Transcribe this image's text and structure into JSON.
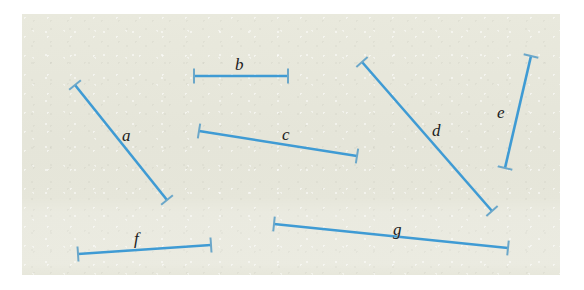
{
  "figure": {
    "paper_color": "#e6e6da",
    "page_color": "#ffffff",
    "segment_color": "#3f9bd4",
    "tick_color": "#6ba7c9",
    "label_color": "#20201c",
    "paper": {
      "x": 22,
      "y": 14,
      "width": 538,
      "height": 261
    }
  },
  "segments": [
    {
      "id": "a",
      "label": "a",
      "x1": 75,
      "y1": 85,
      "x2": 167,
      "y2": 200,
      "tick_len": 15,
      "label_x": 122,
      "label_y": 127
    },
    {
      "id": "b",
      "label": "b",
      "x1": 194,
      "y1": 76,
      "x2": 288,
      "y2": 76,
      "tick_len": 15,
      "label_x": 235,
      "label_y": 56
    },
    {
      "id": "c",
      "label": "c",
      "x1": 199,
      "y1": 131,
      "x2": 357,
      "y2": 156,
      "tick_len": 15,
      "label_x": 282,
      "label_y": 126
    },
    {
      "id": "d",
      "label": "d",
      "x1": 362,
      "y1": 62,
      "x2": 492,
      "y2": 211,
      "tick_len": 15,
      "label_x": 432,
      "label_y": 122
    },
    {
      "id": "e",
      "label": "e",
      "x1": 531,
      "y1": 56,
      "x2": 505,
      "y2": 168,
      "tick_len": 15,
      "label_x": 497,
      "label_y": 104
    },
    {
      "id": "f",
      "label": "f",
      "x1": 78,
      "y1": 254,
      "x2": 211,
      "y2": 245,
      "tick_len": 15,
      "label_x": 134,
      "label_y": 230
    },
    {
      "id": "g",
      "label": "g",
      "x1": 274,
      "y1": 224,
      "x2": 508,
      "y2": 248,
      "tick_len": 15,
      "label_x": 393,
      "label_y": 221
    }
  ]
}
